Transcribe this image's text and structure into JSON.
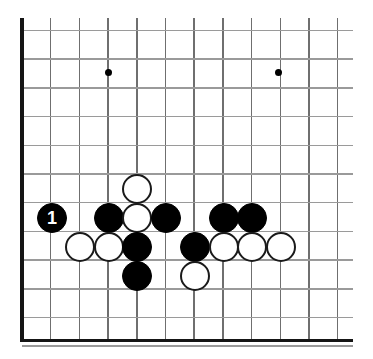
{
  "figure": {
    "board_size_label": "19x19",
    "width": 373,
    "height": 359,
    "background_color": "#ffffff",
    "line_color": "#8d8d8d",
    "edge_color": "#151515",
    "black_stone_color": "#000000",
    "white_stone_color": "#ffffff",
    "white_stone_border_color": "#1a1a1a",
    "move_label_color": "#ffffff"
  },
  "geometry": {
    "origin_x": 22,
    "origin_y": 30.5,
    "spacing": 28.7,
    "columns": 12,
    "rows": 12,
    "stone_diameter": 30,
    "edges_visible": [
      "left",
      "bottom"
    ],
    "cropped_edges": [
      "top",
      "right"
    ]
  },
  "star_points": [
    {
      "name": "star-point-left",
      "col": 3,
      "row": 1.5,
      "x": 108,
      "y": 72
    },
    {
      "name": "star-point-right",
      "col": 9,
      "row": 1.5,
      "x": 278,
      "y": 72
    }
  ],
  "chart_data": {
    "type": "scatter",
    "xlabel": "",
    "ylabel": "",
    "grid": true,
    "legend": "none",
    "stones": [
      {
        "id": "b1",
        "color": "black",
        "label": "1",
        "x": 52,
        "y": 218
      },
      {
        "id": "w1",
        "color": "white",
        "label": "",
        "x": 137,
        "y": 189
      },
      {
        "id": "b2",
        "color": "black",
        "label": "",
        "x": 109,
        "y": 218
      },
      {
        "id": "w2",
        "color": "white",
        "label": "",
        "x": 137,
        "y": 218
      },
      {
        "id": "b3",
        "color": "black",
        "label": "",
        "x": 166,
        "y": 218
      },
      {
        "id": "b4",
        "color": "black",
        "label": "",
        "x": 224,
        "y": 218
      },
      {
        "id": "b5",
        "color": "black",
        "label": "",
        "x": 252,
        "y": 218
      },
      {
        "id": "w3",
        "color": "white",
        "label": "",
        "x": 80,
        "y": 247
      },
      {
        "id": "w4",
        "color": "white",
        "label": "",
        "x": 109,
        "y": 247
      },
      {
        "id": "b6",
        "color": "black",
        "label": "",
        "x": 137,
        "y": 247
      },
      {
        "id": "b7",
        "color": "black",
        "label": "",
        "x": 195,
        "y": 247
      },
      {
        "id": "w5",
        "color": "white",
        "label": "",
        "x": 224,
        "y": 247
      },
      {
        "id": "w6",
        "color": "white",
        "label": "",
        "x": 252,
        "y": 247
      },
      {
        "id": "w7",
        "color": "white",
        "label": "",
        "x": 281,
        "y": 247
      },
      {
        "id": "b8",
        "color": "black",
        "label": "",
        "x": 137,
        "y": 276
      },
      {
        "id": "w8",
        "color": "white",
        "label": "",
        "x": 195,
        "y": 276
      }
    ],
    "counts": {
      "black": 8,
      "white": 8,
      "total": 16
    },
    "numbered_moves": [
      {
        "number": "1",
        "color": "black",
        "x": 52,
        "y": 218
      }
    ]
  }
}
